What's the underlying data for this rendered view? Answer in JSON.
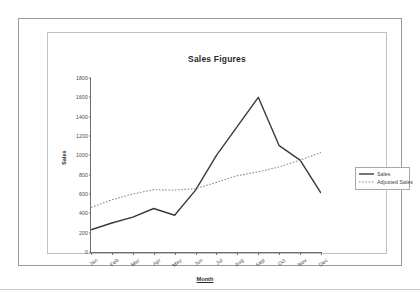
{
  "document": {
    "title": "Sales Figures"
  },
  "chart_data": {
    "type": "line",
    "title": "Sales Figures",
    "xlabel": "Month",
    "ylabel": "Sales",
    "categories": [
      "Jan",
      "Feb",
      "Mar",
      "Apr",
      "May",
      "Jun",
      "Jul",
      "Aug",
      "Sep",
      "Oct",
      "Nov",
      "Dec"
    ],
    "series": [
      {
        "name": "Sales",
        "style": "solid",
        "color": "#3a3a3a",
        "values": [
          230,
          300,
          360,
          450,
          380,
          640,
          1000,
          1300,
          1600,
          1100,
          950,
          610
        ]
      },
      {
        "name": "Adjusted Sales",
        "style": "dotted",
        "color": "#8c8c8c",
        "values": [
          460,
          540,
          600,
          645,
          640,
          655,
          720,
          790,
          830,
          880,
          950,
          1030
        ]
      }
    ],
    "ylim": [
      0,
      1800
    ],
    "yticks": [
      0,
      200,
      400,
      600,
      800,
      1000,
      1200,
      1400,
      1600,
      1800
    ],
    "ytick_labels": [
      "0",
      "200",
      "400",
      "600",
      "800",
      "1000",
      "1200",
      "1400",
      "1600",
      "1800"
    ],
    "grid": false,
    "legend_position": "right",
    "legend_entries": [
      "Sales",
      "Adjusted Sales"
    ]
  }
}
